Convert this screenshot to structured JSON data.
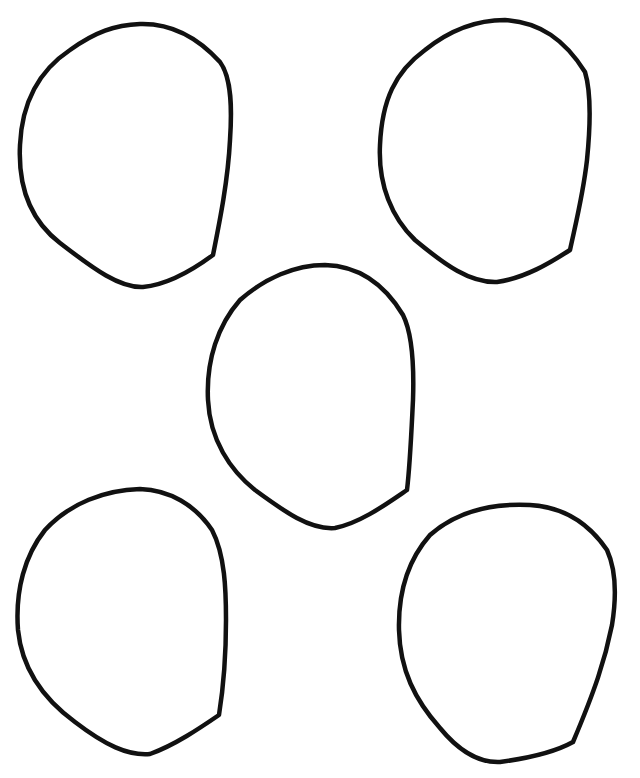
{
  "drawing": {
    "description": "Five hand-drawn irregular rounded outlines on a white sheet",
    "background_color": "#ffffff",
    "stroke_color": "#111111",
    "shapes": [
      {
        "id": "top-left",
        "label": "Outline shape 1"
      },
      {
        "id": "top-right",
        "label": "Outline shape 2"
      },
      {
        "id": "center",
        "label": "Outline shape 3"
      },
      {
        "id": "bottom-left",
        "label": "Outline shape 4"
      },
      {
        "id": "bottom-right",
        "label": "Outline shape 5"
      }
    ]
  }
}
